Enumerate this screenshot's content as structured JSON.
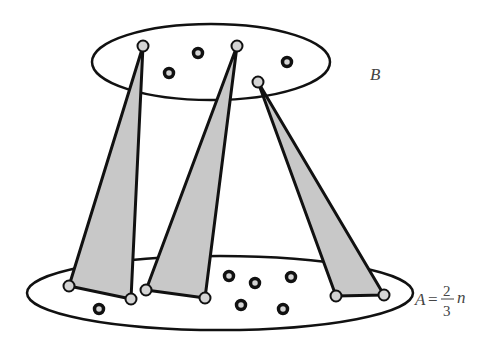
{
  "diagram": {
    "colors": {
      "stroke": "#111111",
      "triangle_fill": "#c8c8c8",
      "light_node_fill": "#d4d4d4",
      "dark_node_fill": "#d4d4d4",
      "label": "#444444"
    },
    "top_set": {
      "label": "B",
      "ellipse": {
        "cx": 211,
        "cy": 62,
        "rx": 119,
        "ry": 38
      }
    },
    "bottom_set": {
      "label_var": "A",
      "label_eq": "=",
      "label_num": "2",
      "label_den": "3",
      "label_suffix": "n",
      "ellipse": {
        "cx": 220,
        "cy": 293,
        "rx": 193,
        "ry": 37
      }
    },
    "triangles": [
      {
        "apex": [
          143,
          46
        ],
        "base": [
          [
            69,
            286
          ],
          [
            131,
            299
          ]
        ]
      },
      {
        "apex": [
          237,
          46
        ],
        "base": [
          [
            146,
            290
          ],
          [
            205,
            298
          ]
        ]
      },
      {
        "apex": [
          258,
          82
        ],
        "base": [
          [
            336,
            296
          ],
          [
            384,
            295
          ]
        ]
      }
    ],
    "top_light_nodes": [
      [
        143,
        46
      ],
      [
        237,
        46
      ],
      [
        258,
        82
      ]
    ],
    "top_dark_nodes": [
      [
        198,
        53
      ],
      [
        169,
        73
      ],
      [
        287,
        62
      ]
    ],
    "bottom_light_nodes": [
      [
        69,
        286
      ],
      [
        131,
        299
      ],
      [
        146,
        290
      ],
      [
        205,
        298
      ],
      [
        336,
        296
      ],
      [
        384,
        295
      ]
    ],
    "bottom_dark_nodes": [
      [
        99,
        309
      ],
      [
        229,
        276
      ],
      [
        255,
        283
      ],
      [
        291,
        277
      ],
      [
        241,
        305
      ],
      [
        283,
        309
      ]
    ]
  }
}
